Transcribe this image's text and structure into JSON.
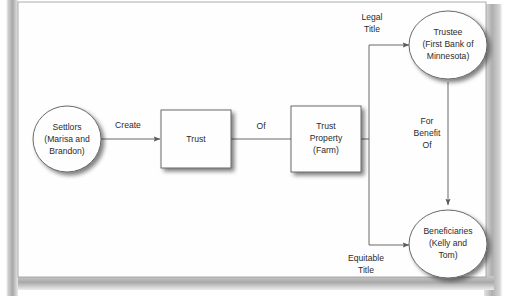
{
  "page": {
    "background_color": "#ffffff",
    "gutter_color": "#b4b4b4",
    "canvas_color": "#fefefe",
    "border_color": "#9a9a9a"
  },
  "diagram": {
    "stroke_color": "#5a5a5a",
    "text_color": "#2b2b2b",
    "shadow_color": "#9a9a9a",
    "nodes": [
      {
        "id": "settlors",
        "shape": "ellipse",
        "lines": [
          "Settlors",
          "(Marisa and",
          "Brandon)"
        ]
      },
      {
        "id": "trust",
        "shape": "rectangle",
        "lines": [
          "Trust"
        ]
      },
      {
        "id": "trust-property",
        "shape": "rectangle",
        "lines": [
          "Trust",
          "Property",
          "(Farm)"
        ]
      },
      {
        "id": "trustee",
        "shape": "ellipse",
        "lines": [
          "Trustee",
          "(First Bank of",
          "Minnesota)"
        ]
      },
      {
        "id": "beneficiaries",
        "shape": "ellipse",
        "lines": [
          "Beneficiaries",
          "(Kelly and",
          "Tom)"
        ]
      }
    ],
    "edges": [
      {
        "id": "settlors-to-trust",
        "from": "settlors",
        "to": "trust",
        "lines": [
          "Create"
        ],
        "arrow": true
      },
      {
        "id": "trust-to-property",
        "from": "trust",
        "to": "trust-property",
        "lines": [
          "Of"
        ],
        "arrow": false
      },
      {
        "id": "property-to-trustee",
        "from": "trust-property",
        "to": "trustee",
        "lines": [
          "Legal",
          "Title"
        ],
        "arrow": true
      },
      {
        "id": "property-to-beneficiaries",
        "from": "trust-property",
        "to": "beneficiaries",
        "lines": [
          "Equitable",
          "Title"
        ],
        "arrow": true
      },
      {
        "id": "trustee-to-beneficiaries",
        "from": "trustee",
        "to": "beneficiaries",
        "lines": [
          "For",
          "Benefit",
          "Of"
        ],
        "arrow": true
      }
    ]
  }
}
